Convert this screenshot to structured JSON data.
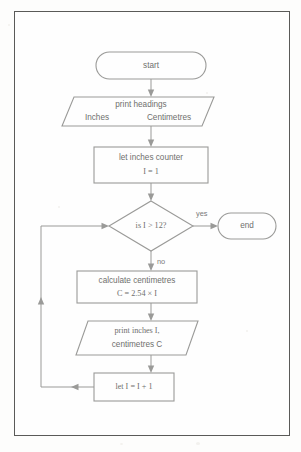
{
  "diagram": {
    "type": "flowchart",
    "colors": {
      "shape_stroke": "#9a9a98",
      "connector": "#9a9a98",
      "text": "#6f6f6d",
      "frame": "#5a5a58",
      "background": "#fefefe"
    },
    "nodes": [
      {
        "id": "start",
        "shape": "terminator",
        "lines": [
          "start"
        ]
      },
      {
        "id": "print-headings",
        "shape": "parallelogram",
        "lines": [
          "print headings",
          "Inches        Centimetres"
        ],
        "line1": "print headings",
        "line2_left": "Inches",
        "line2_right": "Centimetres"
      },
      {
        "id": "init-counter",
        "shape": "process",
        "lines": [
          "let inches counter",
          "I = 1"
        ],
        "line1": "let inches counter",
        "line2": "I = 1"
      },
      {
        "id": "decision",
        "shape": "decision",
        "lines": [
          "is I > 12?"
        ],
        "line1": "is I > 12?"
      },
      {
        "id": "end",
        "shape": "terminator",
        "lines": [
          "end"
        ]
      },
      {
        "id": "calculate",
        "shape": "process",
        "lines": [
          "calculate centimetres",
          "C = 2.54 × I"
        ],
        "line1": "calculate centimetres",
        "line2": "C = 2.54 × I"
      },
      {
        "id": "print-values",
        "shape": "parallelogram",
        "lines": [
          "print inches I,",
          "centimetres C"
        ],
        "line1": "print inches I,",
        "line2": "centimetres C"
      },
      {
        "id": "increment",
        "shape": "process",
        "lines": [
          "let I = I + 1"
        ],
        "line1": "let I = I + 1"
      }
    ],
    "edges": [
      {
        "id": "e1",
        "from": "start",
        "to": "print-headings",
        "label": ""
      },
      {
        "id": "e2",
        "from": "print-headings",
        "to": "init-counter",
        "label": ""
      },
      {
        "id": "e3",
        "from": "init-counter",
        "to": "decision",
        "label": ""
      },
      {
        "id": "e4",
        "from": "decision",
        "to": "end",
        "label": "yes"
      },
      {
        "id": "e5",
        "from": "decision",
        "to": "calculate",
        "label": "no"
      },
      {
        "id": "e6",
        "from": "calculate",
        "to": "print-values",
        "label": ""
      },
      {
        "id": "e7",
        "from": "print-values",
        "to": "increment",
        "label": ""
      },
      {
        "id": "e8",
        "from": "increment",
        "to": "decision",
        "label": ""
      }
    ]
  }
}
